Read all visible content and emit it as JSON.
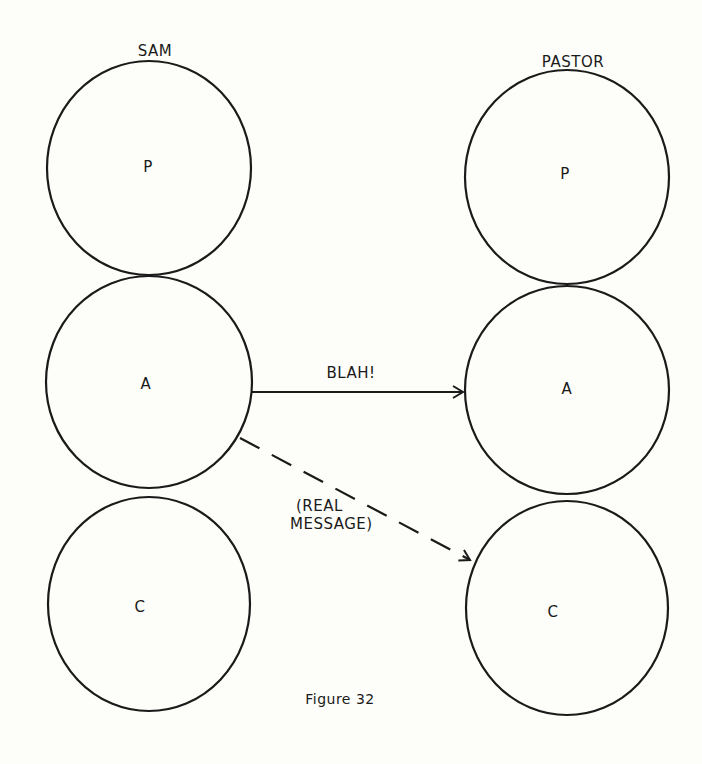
{
  "diagram": {
    "type": "communication-model",
    "people": [
      {
        "name": "SAM",
        "circles": [
          {
            "id": "sam-p",
            "label": "P",
            "cx": 149,
            "cy": 168,
            "r": 103
          },
          {
            "id": "sam-a",
            "label": "A",
            "cx": 149,
            "cy": 382,
            "r": 104
          },
          {
            "id": "sam-c",
            "label": "C",
            "cx": 149,
            "cy": 604,
            "r": 102
          }
        ]
      },
      {
        "name": "PASTOR",
        "circles": [
          {
            "id": "pastor-p",
            "label": "P",
            "cx": 567,
            "cy": 177,
            "r": 103
          },
          {
            "id": "pastor-a",
            "label": "A",
            "cx": 567,
            "cy": 387,
            "r": 102
          },
          {
            "id": "pastor-c",
            "label": "C",
            "cx": 567,
            "cy": 611,
            "r": 102
          }
        ]
      }
    ],
    "arrows": [
      {
        "from": "sam-a",
        "to": "pastor-a",
        "style": "solid",
        "label": "BLAH!"
      },
      {
        "from": "sam-a",
        "to": "pastor-c",
        "style": "dashed",
        "label_line1": "(REAL",
        "label_line2": "MESSAGE)"
      }
    ],
    "caption": "Figure 32"
  },
  "colors": {
    "stroke": "#1a1a1a",
    "background": "#fdfdf9"
  }
}
